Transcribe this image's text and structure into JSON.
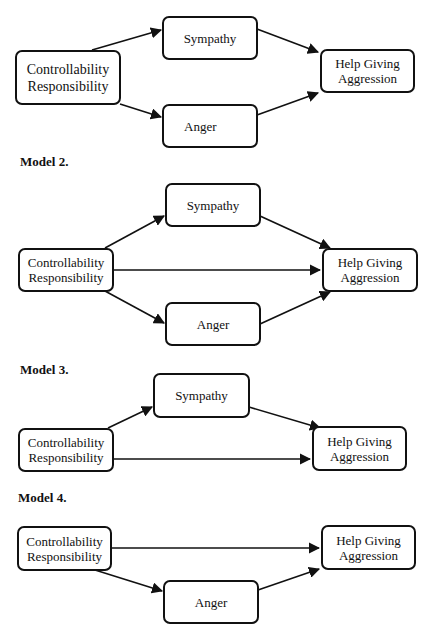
{
  "models": [
    {
      "label": "",
      "nodes": {
        "cause": [
          "Controllability",
          "Responsibility"
        ],
        "sympathy": "Sympathy",
        "anger": "Anger",
        "outcome": [
          "Help Giving",
          "Aggression"
        ]
      },
      "edges": [
        [
          "cause",
          "sympathy"
        ],
        [
          "cause",
          "anger"
        ],
        [
          "sympathy",
          "outcome"
        ],
        [
          "anger",
          "outcome"
        ]
      ]
    },
    {
      "label": "Model 2.",
      "nodes": {
        "cause": [
          "Controllability",
          "Responsibility"
        ],
        "sympathy": "Sympathy",
        "anger": "Anger",
        "outcome": [
          "Help Giving",
          "Aggression"
        ]
      },
      "edges": [
        [
          "cause",
          "sympathy"
        ],
        [
          "cause",
          "anger"
        ],
        [
          "cause",
          "outcome"
        ],
        [
          "sympathy",
          "outcome"
        ],
        [
          "anger",
          "outcome"
        ]
      ]
    },
    {
      "label": "Model 3.",
      "nodes": {
        "cause": [
          "Controllability",
          "Responsibility"
        ],
        "sympathy": "Sympathy",
        "outcome": [
          "Help Giving",
          "Aggression"
        ]
      },
      "edges": [
        [
          "cause",
          "sympathy"
        ],
        [
          "cause",
          "outcome"
        ],
        [
          "sympathy",
          "outcome"
        ]
      ]
    },
    {
      "label": "Model 4.",
      "nodes": {
        "cause": [
          "Controllability",
          "Responsibility"
        ],
        "anger": "Anger",
        "outcome": [
          "Help Giving",
          "Aggression"
        ]
      },
      "edges": [
        [
          "cause",
          "anger"
        ],
        [
          "cause",
          "outcome"
        ],
        [
          "anger",
          "outcome"
        ]
      ]
    }
  ]
}
